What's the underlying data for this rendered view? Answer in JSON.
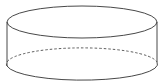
{
  "diagram": {
    "type": "geometric-solid",
    "shape": "cylinder",
    "stroke_color": "#333333",
    "background": "#ffffff",
    "hidden_edge_style": "dashed"
  }
}
